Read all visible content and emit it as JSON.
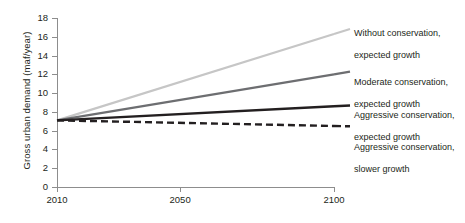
{
  "chart_data": {
    "type": "line",
    "title": "",
    "xlabel": "",
    "ylabel": "Gross urban demand (maf/year)",
    "xlim": [
      2010,
      2100
    ],
    "ylim": [
      0,
      18
    ],
    "grid": false,
    "legend_position": "right-inline-annotations",
    "x": [
      2010,
      2100
    ],
    "xticks": [
      2010,
      2050,
      2100
    ],
    "xtick_labels": [
      "2010",
      "2050",
      "2100"
    ],
    "yticks": [
      0,
      2,
      4,
      6,
      8,
      10,
      12,
      14,
      16,
      18
    ],
    "ytick_labels": [
      "0",
      "2",
      "4",
      "6",
      "8",
      "10",
      "12",
      "14",
      "16",
      "18"
    ],
    "series": [
      {
        "name": "Without conservation, expected growth",
        "label_line1": "Without conservation,",
        "label_line2": "expected growth",
        "values": [
          7.1,
          16.3
        ],
        "color": "#c6c6c6",
        "style": "solid",
        "width": 2.2
      },
      {
        "name": "Moderate conservation, expected growth",
        "label_line1": "Moderate conservation,",
        "label_line2": "expected growth",
        "values": [
          7.1,
          12.0
        ],
        "color": "#6d6e71",
        "style": "solid",
        "width": 2.2
      },
      {
        "name": "Aggressive conservation, expected growth",
        "label_line1": "Aggressive conservation,",
        "label_line2": "expected growth",
        "values": [
          7.1,
          8.6
        ],
        "color": "#231f20",
        "style": "solid",
        "width": 2.4
      },
      {
        "name": "Aggressive conservation, slower growth",
        "label_line1": "Aggressive conservation,",
        "label_line2": "slower growth",
        "values": [
          7.1,
          6.5
        ],
        "color": "#231f20",
        "style": "dashed",
        "width": 2.4,
        "dash": "7,4"
      }
    ]
  },
  "axes": {
    "y_title": "Gross urban demand (maf/year)",
    "y_tick_labels": [
      "18",
      "16",
      "14",
      "12",
      "10",
      "8",
      "6",
      "4",
      "2",
      "0"
    ],
    "x_tick_labels": [
      "2010",
      "2050",
      "2100"
    ]
  },
  "annotations": {
    "s0_l1": "Without conservation,",
    "s0_l2": "expected growth",
    "s1_l1": "Moderate conservation,",
    "s1_l2": "expected growth",
    "s2_l1": "Aggressive conservation,",
    "s2_l2": "expected growth",
    "s3_l1": "Aggressive conservation,",
    "s3_l2": "slower growth"
  },
  "colors": {
    "axis": "#8d8d8d",
    "text": "#231f20",
    "series_light": "#c6c6c6",
    "series_mid": "#6d6e71",
    "series_dark": "#231f20",
    "background": "#ffffff"
  }
}
